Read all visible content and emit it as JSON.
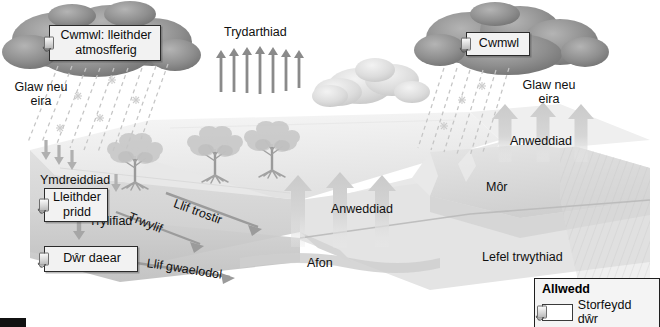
{
  "diagram": {
    "language": "cy",
    "labels": {
      "cloud_left": "Cwmwl: lleithder atmosfferig",
      "cloud_right": "Cwmwl",
      "precip_left": "Glaw neu eira",
      "precip_right": "Glaw neu eira",
      "transpiration": "Trydarthiad",
      "evaporation_land": "Anweddiad",
      "evaporation_sea": "Anweddiad",
      "infiltration": "Ymdreiddiad",
      "soil_moisture": "Lleithder pridd",
      "percolation": "Trylifiad",
      "groundwater": "Dŵr daear",
      "throughflow": "Trwylif",
      "overland_flow": "Llif trostir",
      "baseflow": "Llif gwaelodol",
      "river": "Afon",
      "sea": "Môr",
      "water_table": "Lefel trwythiad"
    },
    "legend": {
      "title": "Allwedd",
      "entries": [
        {
          "swatch": "water-store-glyph",
          "label": "Storfeydd dŵr"
        }
      ]
    },
    "colors": {
      "cloud_dark": "#8d8d8d",
      "cloud_light": "#d2d2d2",
      "land_light": "#ececec",
      "land_mid": "#d9d9d9",
      "land_dark": "#c3c3c3",
      "water": "#d0d0d0",
      "arrow_thick": "#d4d4d4",
      "arrow_thin": "#8a8a8a",
      "text": "#101010",
      "box_fill": "#f2f2f2",
      "box_border": "#2b2b2b"
    },
    "counts": {
      "transpiration_arrows": 7,
      "evaporation_land_arrows": 3,
      "evaporation_sea_arrows": 3,
      "infiltration_arrows": 3,
      "trees": 3
    }
  }
}
